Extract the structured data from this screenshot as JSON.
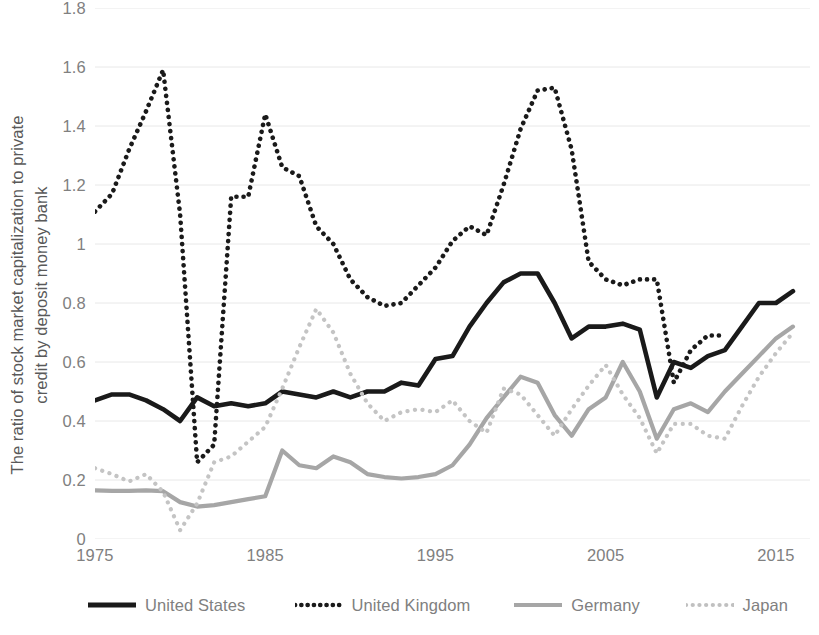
{
  "axis": {
    "y_title": "The ratio of stock market capitalization to private\ncredit by deposit money bank",
    "y_ticks": [
      "1.8",
      "1.6",
      "1.4",
      "1.2",
      "1",
      "0.8",
      "0.6",
      "0.4",
      "0.2",
      "0"
    ],
    "x_ticks": [
      "1975",
      "1985",
      "1995",
      "2005",
      "2015"
    ]
  },
  "legend": {
    "items": [
      {
        "label": "United States",
        "key": "solid-thick-black-line-icon",
        "color": "#1a1a1a"
      },
      {
        "label": "United Kingdom",
        "key": "dotted-black-line-icon",
        "color": "#1a1a1a"
      },
      {
        "label": "Germany",
        "key": "solid-gray-line-icon",
        "color": "#a6a6a6"
      },
      {
        "label": "Japan",
        "key": "dotted-light-gray-line-icon",
        "color": "#c0c0c0"
      }
    ]
  },
  "colors": {
    "united_states": "#1a1a1a",
    "united_kingdom": "#1a1a1a",
    "germany": "#a6a6a6",
    "japan": "#c4c4c4",
    "gridline": "#e8e8e8",
    "tick_text": "#808080",
    "axis_title_text": "#595959"
  },
  "chart_data": {
    "type": "line",
    "title": "",
    "xlabel": "",
    "ylabel": "The ratio of stock market capitalization to private credit by deposit money bank",
    "xlim": [
      1975,
      2017
    ],
    "ylim": [
      0,
      1.8
    ],
    "ytick_values": [
      0,
      0.2,
      0.4,
      0.6,
      0.8,
      1.0,
      1.2,
      1.4,
      1.6,
      1.8
    ],
    "xtick_values": [
      1975,
      1985,
      1995,
      2005,
      2015
    ],
    "grid": true,
    "legend_position": "bottom",
    "x": [
      1975,
      1976,
      1977,
      1978,
      1979,
      1980,
      1981,
      1982,
      1983,
      1984,
      1985,
      1986,
      1987,
      1988,
      1989,
      1990,
      1991,
      1992,
      1993,
      1994,
      1995,
      1996,
      1997,
      1998,
      1999,
      2000,
      2001,
      2002,
      2003,
      2004,
      2005,
      2006,
      2007,
      2008,
      2009,
      2010,
      2011,
      2012,
      2013,
      2014,
      2015,
      2016
    ],
    "series": [
      {
        "name": "United States",
        "color": "#1a1a1a",
        "style": "solid",
        "values": [
          0.47,
          0.49,
          0.49,
          0.47,
          0.44,
          0.4,
          0.48,
          0.45,
          0.46,
          0.45,
          0.46,
          0.5,
          0.49,
          0.48,
          0.5,
          0.48,
          0.5,
          0.5,
          0.53,
          0.52,
          0.61,
          0.62,
          0.72,
          0.8,
          0.87,
          0.9,
          0.9,
          0.8,
          0.68,
          0.72,
          0.72,
          0.73,
          0.71,
          0.48,
          0.6,
          0.58,
          0.62,
          0.64,
          0.72,
          0.8,
          0.8,
          0.84
        ]
      },
      {
        "name": "United Kingdom",
        "color": "#1a1a1a",
        "style": "dotted",
        "values": [
          1.11,
          1.17,
          1.32,
          1.45,
          1.59,
          1.1,
          0.26,
          0.32,
          1.16,
          1.16,
          1.44,
          1.26,
          1.23,
          1.06,
          1.0,
          0.88,
          0.82,
          0.79,
          0.8,
          0.86,
          0.92,
          1.01,
          1.06,
          1.03,
          1.2,
          1.39,
          1.52,
          1.53,
          1.32,
          0.94,
          0.88,
          0.86,
          0.88,
          0.88,
          0.53,
          0.64,
          0.69,
          0.69,
          null,
          null,
          null,
          null
        ]
      },
      {
        "name": "Germany",
        "color": "#a6a6a6",
        "style": "solid",
        "values": [
          0.165,
          0.163,
          0.163,
          0.165,
          0.162,
          0.125,
          0.11,
          0.115,
          0.125,
          0.135,
          0.145,
          0.3,
          0.25,
          0.24,
          0.28,
          0.26,
          0.22,
          0.21,
          0.205,
          0.21,
          0.22,
          0.25,
          0.32,
          0.41,
          0.48,
          0.55,
          0.53,
          0.42,
          0.35,
          0.44,
          0.48,
          0.6,
          0.5,
          0.34,
          0.44,
          0.46,
          0.43,
          0.5,
          0.56,
          0.62,
          0.68,
          0.72
        ]
      },
      {
        "name": "Japan",
        "color": "#c4c4c4",
        "style": "dotted",
        "values": [
          0.24,
          0.22,
          0.195,
          0.22,
          0.16,
          0.03,
          0.12,
          0.26,
          0.28,
          0.33,
          0.38,
          0.51,
          0.65,
          0.78,
          0.7,
          0.56,
          0.46,
          0.4,
          0.43,
          0.44,
          0.43,
          0.47,
          0.4,
          0.36,
          0.51,
          0.49,
          0.42,
          0.35,
          0.44,
          0.52,
          0.59,
          0.49,
          0.41,
          0.29,
          0.39,
          0.39,
          0.35,
          0.34,
          0.45,
          0.55,
          0.63,
          0.7
        ]
      }
    ]
  }
}
